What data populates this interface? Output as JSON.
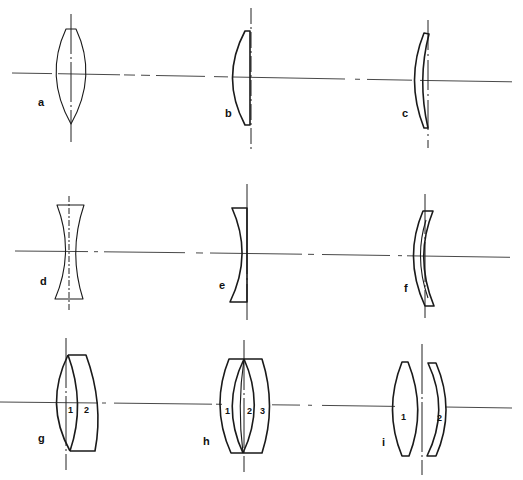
{
  "figure": {
    "ink_color": "#1a1a1a",
    "background": "#ffffff"
  },
  "lenses": [
    {
      "id": "a",
      "label": "a",
      "type": "biconvex",
      "element_numbers": []
    },
    {
      "id": "b",
      "label": "b",
      "type": "plano-convex",
      "element_numbers": []
    },
    {
      "id": "c",
      "label": "c",
      "type": "positive-meniscus",
      "element_numbers": []
    },
    {
      "id": "d",
      "label": "d",
      "type": "biconcave",
      "element_numbers": []
    },
    {
      "id": "e",
      "label": "e",
      "type": "plano-concave",
      "element_numbers": []
    },
    {
      "id": "f",
      "label": "f",
      "type": "negative-meniscus",
      "element_numbers": []
    },
    {
      "id": "g",
      "label": "g",
      "type": "two-element-cemented",
      "element_numbers": [
        "1",
        "2"
      ]
    },
    {
      "id": "h",
      "label": "h",
      "type": "three-element-cemented",
      "element_numbers": [
        "1",
        "2",
        "3"
      ]
    },
    {
      "id": "i",
      "label": "i",
      "type": "two-element-air-spaced",
      "element_numbers": [
        "1",
        "2"
      ]
    }
  ]
}
